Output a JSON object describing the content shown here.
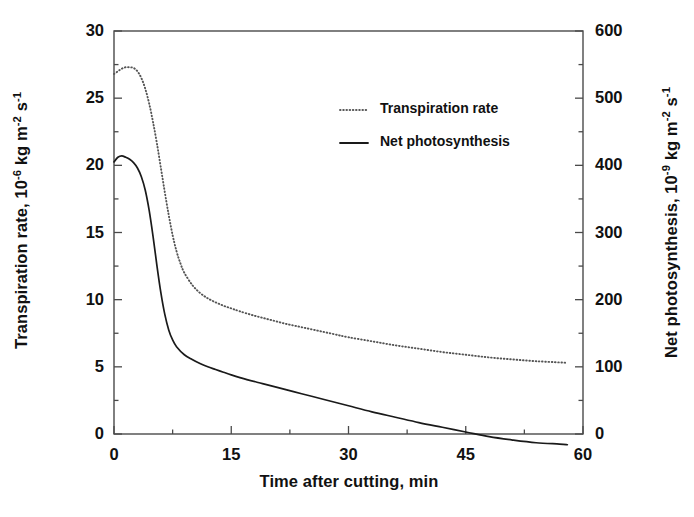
{
  "chart_data": {
    "type": "line",
    "title": "",
    "xlabel": "Time after cutting, min",
    "ylabel": "Transpiration rate, 10-6 kg m-2 s-1",
    "ylabel_secondary": "Net photosynthesis, 10-9 kg m-2 s-1",
    "xlim": [
      0,
      60
    ],
    "ylim": [
      0,
      30
    ],
    "ylim_secondary": [
      0,
      600
    ],
    "xticks": [
      0,
      15,
      30,
      45,
      60
    ],
    "yticks": [
      0,
      5,
      10,
      15,
      20,
      25,
      30
    ],
    "yticks_secondary": [
      0,
      100,
      200,
      300,
      400,
      500,
      600
    ],
    "xminor_interval": 7.5,
    "yminor_interval": 2.5,
    "yminor_interval_secondary": 50,
    "grid": false,
    "legend_position": "upper-center",
    "series": [
      {
        "name": "Transpiration rate",
        "axis": "left",
        "style": "dotted",
        "color": "#555555",
        "x": [
          0,
          0.5,
          1,
          1.5,
          2,
          2.5,
          3,
          3.5,
          4,
          4.5,
          5,
          5.5,
          6,
          6.5,
          7,
          7.5,
          8,
          8.5,
          9,
          10,
          11,
          12,
          13,
          14,
          15,
          16,
          18,
          20,
          22,
          24,
          26,
          28,
          30,
          33,
          36,
          39,
          42,
          45,
          48,
          51,
          54,
          57,
          58
        ],
        "y": [
          26.8,
          27.0,
          27.2,
          27.3,
          27.3,
          27.25,
          27.0,
          26.5,
          25.7,
          24.6,
          23.2,
          21.6,
          19.8,
          18.0,
          16.3,
          14.8,
          13.6,
          12.7,
          12.0,
          11.1,
          10.5,
          10.1,
          9.8,
          9.55,
          9.35,
          9.15,
          8.8,
          8.5,
          8.2,
          7.95,
          7.7,
          7.45,
          7.2,
          6.9,
          6.6,
          6.35,
          6.1,
          5.9,
          5.7,
          5.55,
          5.42,
          5.33,
          5.3
        ]
      },
      {
        "name": "Net photosynthesis",
        "axis": "right",
        "style": "solid",
        "color": "#1a1a1a",
        "x": [
          0,
          0.5,
          1,
          1.5,
          2,
          2.5,
          3,
          3.5,
          4,
          4.5,
          5,
          5.5,
          6,
          6.5,
          7,
          7.5,
          8,
          9,
          10,
          11,
          12,
          13,
          14,
          15,
          17,
          19,
          21,
          24,
          27,
          30,
          33,
          36,
          39,
          42,
          45,
          48,
          51,
          54,
          57,
          58
        ],
        "y_secondary": [
          405,
          412,
          414,
          412,
          409,
          404,
          396,
          383,
          363,
          333,
          294,
          250,
          210,
          178,
          155,
          140,
          130,
          118,
          111,
          105,
          100,
          96,
          92,
          88,
          81,
          75,
          69,
          60,
          51,
          42,
          33,
          25,
          17,
          10,
          3,
          -4,
          -9,
          -13,
          -15,
          -16
        ]
      }
    ],
    "legend": [
      {
        "label": "Transpiration rate",
        "style": "dotted"
      },
      {
        "label": "Net photosynthesis",
        "style": "solid"
      }
    ]
  },
  "axes": {
    "left_title_parts": {
      "a": "Transpiration rate, 10",
      "exp1": "-6",
      "b": " kg m",
      "exp2": "-2",
      "c": " s",
      "exp3": "-1"
    },
    "right_title_parts": {
      "a": "Net photosynthesis, 10",
      "exp1": "-9",
      "b": " kg m",
      "exp2": "-2",
      "c": " s",
      "exp3": "-1"
    },
    "x_title": "Time after cutting, min",
    "left_ticks": [
      "30",
      "25",
      "20",
      "15",
      "10",
      "5",
      "0"
    ],
    "right_ticks": [
      "600",
      "500",
      "400",
      "300",
      "200",
      "100",
      "0"
    ],
    "bottom_ticks": [
      "0",
      "15",
      "30",
      "45",
      "60"
    ]
  },
  "legend": {
    "items": [
      {
        "label": "Transpiration rate"
      },
      {
        "label": "Net photosynthesis"
      }
    ]
  },
  "colors": {
    "frame": "#4a4a4a",
    "solid_line": "#1a1a1a",
    "dotted_line": "#5a5a5a",
    "text": "#111111"
  }
}
